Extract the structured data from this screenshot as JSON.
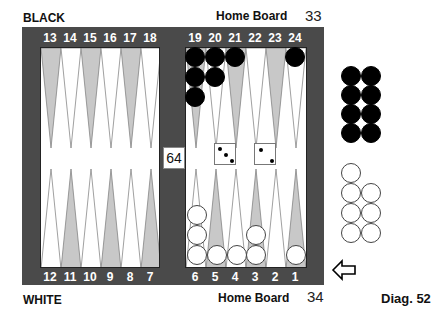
{
  "labels": {
    "top_player": "BLACK",
    "bottom_player": "WHITE",
    "top_home": "Home Board",
    "bottom_home": "Home Board",
    "top_pipcount": "33",
    "bottom_pipcount": "34",
    "diagram": "Diag. 52"
  },
  "doubling_cube": "64",
  "dice": [
    3,
    2
  ],
  "colors": {
    "frame": "#4a4a4a",
    "point_dark": "#c8c8c8",
    "point_light": "#ffffff",
    "black_checker": "#000000",
    "white_checker": "#ffffff"
  },
  "top_points": [
    "13",
    "14",
    "15",
    "16",
    "17",
    "18",
    "19",
    "20",
    "21",
    "22",
    "23",
    "24"
  ],
  "bottom_points": [
    "12",
    "11",
    "10",
    "9",
    "8",
    "7",
    "6",
    "5",
    "4",
    "3",
    "2",
    "1"
  ],
  "position": {
    "black": {
      "19": 3,
      "20": 2,
      "21": 1,
      "24": 1
    },
    "white": {
      "6": 3,
      "5": 1,
      "4": 1,
      "3": 2,
      "1": 1
    },
    "black_off": 8,
    "white_off": 7
  },
  "turn_indicator": "white-to-move-arrow"
}
